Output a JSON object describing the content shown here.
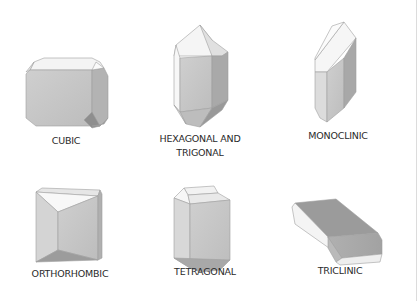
{
  "figure": {
    "crystals": [
      {
        "id": "cubic",
        "label": "CUBIC"
      },
      {
        "id": "hexagonal-trigonal",
        "label_line1": "HEXAGONAL AND",
        "label_line2": "TRIGONAL"
      },
      {
        "id": "monoclinic",
        "label": "MONOCLINIC"
      },
      {
        "id": "orthorhombic",
        "label": "ORTHORHOMBIC"
      },
      {
        "id": "tetragonal",
        "label": "TETRAGONAL"
      },
      {
        "id": "triclinic",
        "label": "TRICLINIC"
      }
    ]
  },
  "colors": {
    "background": "#ffffff",
    "face_light": "#f3f3f3",
    "face_mid": "#c8c8c8",
    "face_dark": "#a9a9a9",
    "face_darker": "#8f8f8f",
    "edge": "#9a9a9a",
    "text": "#2a2a2a"
  }
}
